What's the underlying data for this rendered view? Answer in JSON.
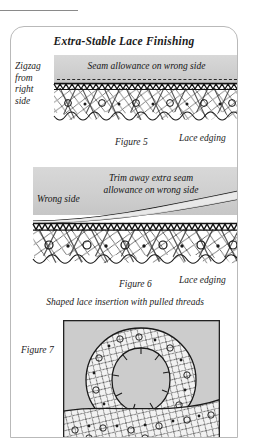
{
  "page": {
    "width": 255,
    "height": 440,
    "background": "#ffffff",
    "rule_color": "#8a8a8a"
  },
  "panel": {
    "title": "Extra-Stable Lace Finishing",
    "border_color": "#b9b9b9"
  },
  "figure5": {
    "side_label": "Zigzag\nfrom\nright\nside",
    "band_text": "Seam allowance on wrong side",
    "caption": "Figure 5",
    "edge_label": "Lace edging",
    "band_color": "#cfcfcf"
  },
  "figure6": {
    "left_label": "Wrong side",
    "band_text_line1": "Trim away extra seam",
    "band_text_line2": "allowance on wrong side",
    "caption": "Figure 6",
    "edge_label": "Lace edging",
    "band_color": "#cfcfcf"
  },
  "figure7": {
    "heading": "Shaped lace insertion with pulled threads",
    "caption": "Figure 7",
    "fill_color": "#cccccc",
    "border_color": "#222222"
  },
  "colors": {
    "ink": "#1b1b1b",
    "stitch": "#1a1a1a",
    "gray_fabric": "#cfcfcf",
    "net": "#555555"
  }
}
